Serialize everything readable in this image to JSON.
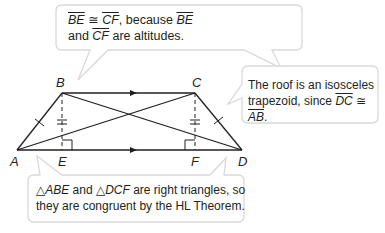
{
  "diagram": {
    "type": "geometry-proof-diagram",
    "figure": "isosceles trapezoid ABCD with altitudes BE and CF",
    "vertices": {
      "A": "A",
      "B": "B",
      "C": "C",
      "D": "D",
      "E": "E",
      "F": "F"
    },
    "colors": {
      "line": "#231f20",
      "callout_border": "#d9d9d9",
      "callout_fill": "#ffffff"
    }
  },
  "callouts": {
    "top": {
      "seg1": "BE",
      "congruent": "≅",
      "seg2": "CF",
      "text1": ", because ",
      "seg3": "BE",
      "text2": "and ",
      "seg4": "CF",
      "text3": " are altitudes."
    },
    "right": {
      "line1": "The roof is an isosceles",
      "text1": "trapezoid, since ",
      "seg1": "DC",
      "congruent": " ≅ ",
      "seg2": "AB",
      "text2": "."
    },
    "bottom": {
      "tri": "△",
      "tri1": "ABE",
      "and": " and ",
      "tri2": "DCF",
      "text1": " are right triangles, so",
      "line2": "they are congruent by the HL Theorem."
    }
  }
}
